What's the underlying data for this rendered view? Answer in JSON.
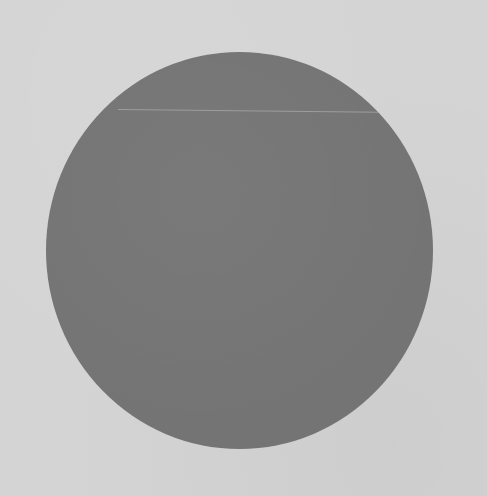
{
  "image": {
    "description": "Scanned photograph of a solid dark gray circle centered on a light gray paper background",
    "background_color": "#d4d4d4",
    "circle": {
      "color": "#747474",
      "center": [
        239,
        250
      ],
      "width": 387,
      "height": 397
    },
    "artifacts": [
      "faint horizontal scan line near top of circle"
    ]
  }
}
